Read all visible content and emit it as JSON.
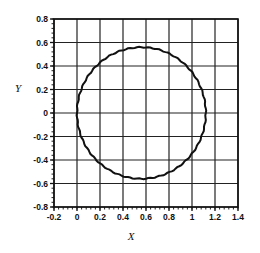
{
  "chart_data": {
    "type": "line",
    "title": "",
    "xlabel": "X",
    "ylabel": "Y",
    "xlim": [
      -0.2,
      1.4
    ],
    "ylim": [
      -0.8,
      0.8
    ],
    "xticks": [
      -0.2,
      0,
      0.2,
      0.4,
      0.6,
      0.8,
      1,
      1.2,
      1.4
    ],
    "xtick_labels": [
      "-0.2",
      "0",
      "0.2",
      "0.4",
      "0.6",
      "0.8",
      "1",
      "1.2",
      "1.4"
    ],
    "yticks": [
      0.8,
      0.6,
      0.4,
      0.2,
      0,
      -0.2,
      -0.4,
      -0.6,
      -0.8
    ],
    "ytick_labels": [
      "0.8",
      "0.6",
      "0.4",
      "0.2",
      "0",
      "-0.2",
      "-0.4",
      "-0.6",
      "-0.8"
    ],
    "grid": true,
    "legend": null,
    "series": [
      {
        "name": "circle",
        "shape": "circle",
        "center": [
          0.56,
          0
        ],
        "radius": 0.56,
        "color": "#111111"
      }
    ]
  },
  "plot_area": {
    "left": 54,
    "right": 238,
    "top": 19,
    "bottom": 207
  }
}
